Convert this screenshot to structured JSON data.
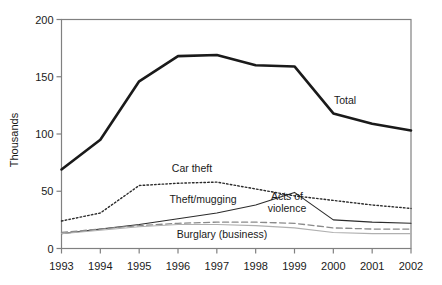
{
  "chart_data": {
    "type": "line",
    "title": "",
    "xlabel": "",
    "ylabel": "Thousands",
    "x": [
      1993,
      1994,
      1995,
      1996,
      1997,
      1998,
      1999,
      2000,
      2001,
      2002
    ],
    "xtick_labels": [
      "1993",
      "1994",
      "1995",
      "1996",
      "1997",
      "1998",
      "1999",
      "2000",
      "2001",
      "2002"
    ],
    "ytick_labels": [
      "0",
      "50",
      "100",
      "150",
      "200"
    ],
    "yticks": [
      0,
      50,
      100,
      150,
      200
    ],
    "ylim": [
      0,
      200
    ],
    "xlim": [
      1993,
      2002
    ],
    "grid": false,
    "legend_position": "inline-annotations",
    "series": [
      {
        "name": "Total",
        "label": "Total",
        "style": "solid-thick",
        "color": "#1a1a1a",
        "values": [
          69,
          95,
          146,
          168,
          169,
          160,
          159,
          118,
          109,
          103
        ]
      },
      {
        "name": "Car theft",
        "label": "Car theft",
        "style": "dotted",
        "color": "#2b2b2b",
        "values": [
          24,
          31,
          55,
          57,
          58,
          52,
          46,
          42,
          38,
          35
        ]
      },
      {
        "name": "Theft/mugging",
        "label": "Theft/mugging",
        "style": "solid-thin",
        "color": "#2b2b2b",
        "values": [
          13,
          17,
          21,
          26,
          31,
          38,
          49,
          25,
          23,
          22
        ]
      },
      {
        "name": "Acts of violence",
        "label": "Acts of violence",
        "style": "dashed",
        "color": "#8a8a8a",
        "values": [
          14,
          17,
          20,
          22,
          23,
          23,
          22,
          18,
          17,
          17
        ]
      },
      {
        "name": "Burglary (business)",
        "label": "Burglary (business)",
        "style": "solid-light",
        "color": "#b0b0b0",
        "values": [
          13,
          16,
          19,
          21,
          21,
          20,
          18,
          14,
          13,
          13
        ]
      }
    ],
    "annotations": [
      {
        "text": "Total",
        "x_px": 345,
        "y_px": 104
      },
      {
        "text": "Car theft",
        "x_px": 192,
        "y_px": 172
      },
      {
        "text": "Theft/mugging",
        "x_px": 203,
        "y_px": 203
      },
      {
        "text": "Acts of",
        "x_px": 287,
        "y_px": 200
      },
      {
        "text": "violence",
        "x_px": 287,
        "y_px": 212
      },
      {
        "text": "Burglary (business)",
        "x_px": 222,
        "y_px": 238
      }
    ]
  },
  "axis": {
    "y_title": "Thousands"
  },
  "colors": {
    "axis": "#808080",
    "text": "#1a1a1a",
    "total_line": "#1a1a1a",
    "car_theft_line": "#2b2b2b",
    "theft_mugging_line": "#2b2b2b",
    "violence_line": "#8a8a8a",
    "burglary_line": "#b0b0b0",
    "background": "#ffffff"
  }
}
